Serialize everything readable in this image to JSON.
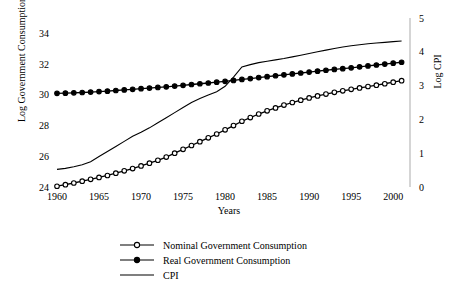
{
  "chart_data": {
    "type": "line",
    "title": "",
    "xlabel": "Years",
    "ylabel": "Log Government Consumption",
    "ylabel_right": "Log CPI",
    "xlim": [
      1960,
      2002
    ],
    "ylim": [
      24,
      35
    ],
    "ylim_right": [
      0,
      5
    ],
    "grid": false,
    "legend_position": "bottom-center",
    "xticks": [
      1960,
      1965,
      1970,
      1975,
      1980,
      1985,
      1990,
      1995,
      2000
    ],
    "yticks_left": [
      24,
      26,
      28,
      30,
      32,
      34
    ],
    "yticks_right": [
      0,
      1,
      2,
      3,
      4,
      5
    ],
    "x": [
      1960,
      1961,
      1962,
      1963,
      1964,
      1965,
      1966,
      1967,
      1968,
      1969,
      1970,
      1971,
      1972,
      1973,
      1974,
      1975,
      1976,
      1977,
      1978,
      1979,
      1980,
      1981,
      1982,
      1983,
      1984,
      1985,
      1986,
      1987,
      1988,
      1989,
      1990,
      1991,
      1992,
      1993,
      1994,
      1995,
      1996,
      1997,
      1998,
      1999,
      2000,
      2001
    ],
    "series": [
      {
        "name": "Nominal Government Consumption",
        "axis": "left",
        "marker": "open-circle",
        "values": [
          24.05,
          24.15,
          24.26,
          24.38,
          24.5,
          24.62,
          24.75,
          24.9,
          25.05,
          25.2,
          25.37,
          25.55,
          25.74,
          25.95,
          26.2,
          26.45,
          26.7,
          26.95,
          27.2,
          27.45,
          27.72,
          28.0,
          28.28,
          28.52,
          28.75,
          28.96,
          29.15,
          29.33,
          29.5,
          29.65,
          29.8,
          29.93,
          30.05,
          30.16,
          30.26,
          30.36,
          30.45,
          30.54,
          30.63,
          30.72,
          30.82,
          30.92
        ]
      },
      {
        "name": "Real Government Consumption",
        "axis": "left",
        "marker": "filled-circle",
        "values": [
          30.1,
          30.11,
          30.13,
          30.15,
          30.18,
          30.21,
          30.24,
          30.28,
          30.32,
          30.36,
          30.4,
          30.44,
          30.48,
          30.52,
          30.57,
          30.62,
          30.67,
          30.72,
          30.77,
          30.82,
          30.88,
          30.94,
          31.0,
          31.06,
          31.12,
          31.18,
          31.24,
          31.3,
          31.36,
          31.42,
          31.48,
          31.54,
          31.6,
          31.65,
          31.7,
          31.76,
          31.82,
          31.88,
          31.94,
          32.0,
          32.06,
          32.12
        ]
      },
      {
        "name": "CPI",
        "axis": "right",
        "marker": "none",
        "values": [
          0.52,
          0.55,
          0.6,
          0.66,
          0.75,
          0.9,
          1.05,
          1.2,
          1.35,
          1.5,
          1.62,
          1.75,
          1.9,
          2.05,
          2.2,
          2.35,
          2.5,
          2.62,
          2.72,
          2.82,
          2.98,
          3.25,
          3.55,
          3.62,
          3.68,
          3.72,
          3.76,
          3.8,
          3.85,
          3.9,
          3.95,
          4.0,
          4.05,
          4.1,
          4.14,
          4.18,
          4.21,
          4.24,
          4.26,
          4.28,
          4.3,
          4.32
        ]
      }
    ],
    "legend": [
      {
        "label": "Nominal Government Consumption",
        "marker": "open-circle"
      },
      {
        "label": "Real Government Consumption",
        "marker": "filled-circle"
      },
      {
        "label": "CPI",
        "marker": "line"
      }
    ]
  }
}
